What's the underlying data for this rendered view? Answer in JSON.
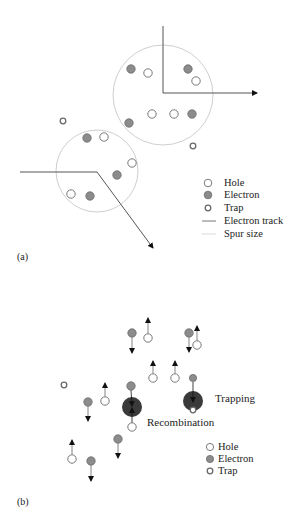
{
  "colors": {
    "hole_fill": "#ffffff",
    "hole_stroke": "#7a7a7a",
    "electron_fill": "#8c8c8c",
    "electron_stroke": "#6a6a6a",
    "trap_stroke": "#6a6a6a",
    "track": "#555555",
    "spur": "#cfcfcf",
    "dark_site": "#3a3a3a",
    "text": "#222222"
  },
  "panel_a": {
    "label": "(a)",
    "spurs": [
      {
        "cx": 163,
        "cy": 95,
        "r": 50
      },
      {
        "cx": 97,
        "cy": 171,
        "r": 41
      }
    ],
    "tracks": [
      {
        "points": [
          [
            163,
            26
          ],
          [
            163,
            93
          ],
          [
            257,
            93
          ]
        ]
      },
      {
        "points": [
          [
            20,
            172
          ],
          [
            97,
            172
          ],
          [
            153,
            248
          ]
        ]
      }
    ],
    "holes": [
      [
        148,
        73
      ],
      [
        196,
        81
      ],
      [
        152,
        114
      ],
      [
        174,
        114
      ],
      [
        104,
        137
      ],
      [
        132,
        163
      ],
      [
        71,
        194
      ]
    ],
    "electrons": [
      [
        131,
        69
      ],
      [
        188,
        69
      ],
      [
        192,
        114
      ],
      [
        129,
        123
      ],
      [
        87,
        138
      ],
      [
        117,
        175
      ],
      [
        90,
        196
      ]
    ],
    "traps": [
      [
        63,
        121
      ],
      [
        193,
        146
      ]
    ],
    "legend": {
      "hole": "Hole",
      "electron": "Electron",
      "trap": "Trap",
      "track": "Electron track",
      "spur": "Spur size"
    }
  },
  "panel_b": {
    "label": "(b)",
    "movers": [
      {
        "type": "electron",
        "x": 132,
        "y": 333,
        "dir": "down",
        "tip": 353
      },
      {
        "type": "hole",
        "x": 148,
        "y": 338,
        "dir": "up",
        "tip": 318
      },
      {
        "type": "electron",
        "x": 189,
        "y": 333,
        "dir": "down",
        "tip": 352
      },
      {
        "type": "hole",
        "x": 197,
        "y": 345,
        "dir": "up",
        "tip": 326
      },
      {
        "type": "hole",
        "x": 153,
        "y": 378,
        "dir": "up",
        "tip": 361
      },
      {
        "type": "hole",
        "x": 175,
        "y": 378,
        "dir": "up",
        "tip": 361
      },
      {
        "type": "electron",
        "x": 88,
        "y": 402,
        "dir": "down",
        "tip": 421
      },
      {
        "type": "hole",
        "x": 105,
        "y": 401,
        "dir": "up",
        "tip": 383
      },
      {
        "type": "electron",
        "x": 118,
        "y": 439,
        "dir": "down",
        "tip": 458
      },
      {
        "type": "hole",
        "x": 72,
        "y": 459,
        "dir": "up",
        "tip": 440
      },
      {
        "type": "electron",
        "x": 91,
        "y": 461,
        "dir": "down",
        "tip": 481
      }
    ],
    "traps": [
      [
        64,
        385
      ]
    ],
    "recombination": {
      "label": "Recombination",
      "site": {
        "cx": 132,
        "cy": 407,
        "r": 10
      },
      "electron": [
        131,
        386
      ],
      "hole": [
        132,
        427
      ]
    },
    "trapping": {
      "label": "Trapping",
      "site": {
        "cx": 193,
        "cy": 401,
        "r": 10
      },
      "electron": [
        193,
        378
      ],
      "trap": [
        193,
        410
      ]
    },
    "legend": {
      "hole": "Hole",
      "electron": "Electron",
      "trap": "Trap"
    }
  }
}
